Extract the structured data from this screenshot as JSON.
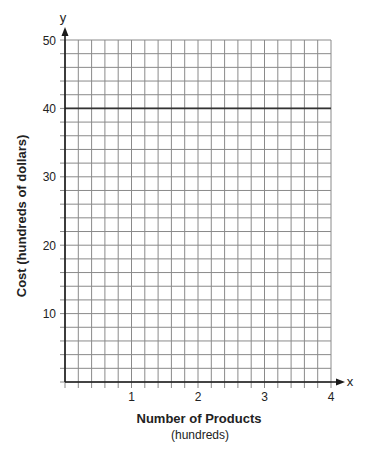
{
  "chart_data": {
    "type": "line",
    "title": "",
    "xlabel": "Number of Products",
    "xlabel_sub": "(hundreds)",
    "ylabel": "Cost (hundreds of dollars)",
    "x_axis_name": "x",
    "y_axis_name": "y",
    "xlim": [
      0,
      4
    ],
    "ylim": [
      0,
      50
    ],
    "x_ticks": [
      1,
      2,
      3,
      4
    ],
    "y_ticks": [
      10,
      20,
      30,
      40,
      50
    ],
    "x_minor_step": 0.2,
    "y_minor_step": 2,
    "grid": true,
    "legend": null,
    "series": [
      {
        "name": "horizontal line y = 40",
        "x": [
          0,
          4
        ],
        "y": [
          40,
          40
        ]
      }
    ]
  },
  "colors": {
    "grid": "#8a8a8a",
    "axis": "#1a1a1a",
    "series": "#333333",
    "text": "#222222"
  },
  "layout": {
    "origin_px": [
      65,
      382
    ],
    "x_end_px": 331,
    "y_top_px": 40
  }
}
